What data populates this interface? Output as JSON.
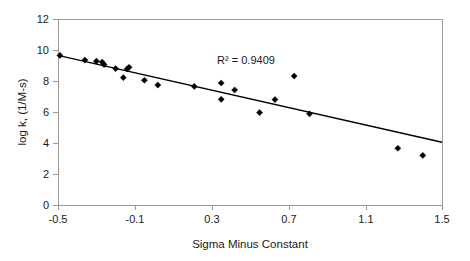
{
  "chart_data": {
    "type": "scatter",
    "title": "",
    "xlabel": "Sigma Minus Constant",
    "ylabel": "log k, (1/M-s)",
    "xlim": [
      -0.5,
      1.5
    ],
    "ylim": [
      0,
      12
    ],
    "xticks": [
      "-0.5",
      "-0.1",
      "0.3",
      "0.7",
      "1.1",
      "1.5"
    ],
    "xtick_values": [
      -0.5,
      -0.1,
      0.3,
      0.7,
      1.1,
      1.5
    ],
    "yticks": [
      "0",
      "2",
      "4",
      "6",
      "8",
      "10",
      "12"
    ],
    "ytick_values": [
      0,
      2,
      4,
      6,
      8,
      10,
      12
    ],
    "grid": false,
    "legend": "none",
    "marker": "diamond",
    "marker_color": "#000000",
    "points": [
      {
        "x": -0.49,
        "y": 9.65
      },
      {
        "x": -0.36,
        "y": 9.35
      },
      {
        "x": -0.3,
        "y": 9.28
      },
      {
        "x": -0.27,
        "y": 9.22
      },
      {
        "x": -0.26,
        "y": 9.06
      },
      {
        "x": -0.2,
        "y": 8.8
      },
      {
        "x": -0.16,
        "y": 8.22
      },
      {
        "x": -0.14,
        "y": 8.78
      },
      {
        "x": -0.13,
        "y": 8.88
      },
      {
        "x": -0.05,
        "y": 8.05
      },
      {
        "x": 0.02,
        "y": 7.74
      },
      {
        "x": 0.21,
        "y": 7.65
      },
      {
        "x": 0.35,
        "y": 7.87
      },
      {
        "x": 0.35,
        "y": 6.82
      },
      {
        "x": 0.42,
        "y": 7.42
      },
      {
        "x": 0.55,
        "y": 5.96
      },
      {
        "x": 0.63,
        "y": 6.8
      },
      {
        "x": 0.73,
        "y": 8.32
      },
      {
        "x": 0.81,
        "y": 5.88
      },
      {
        "x": 1.27,
        "y": 3.66
      },
      {
        "x": 1.4,
        "y": 3.2
      }
    ],
    "fit_line": {
      "label": "linear trendline",
      "x_start": -0.5,
      "y_start": 9.65,
      "x_end": 1.5,
      "y_end": 4.05
    },
    "annotations": [
      {
        "name": "r-squared",
        "text": "R²  =  0.9409",
        "x": 0.44,
        "y": 10.0
      }
    ]
  }
}
